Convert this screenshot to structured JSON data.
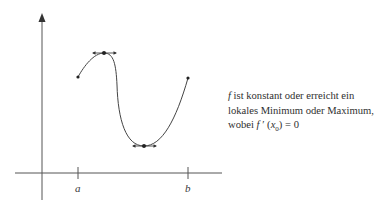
{
  "diagram": {
    "type": "function-graph",
    "axes": {
      "x_tick_labels": [
        "a",
        "b"
      ]
    },
    "curve": {
      "description": "Stetige Funktion f auf [a, b] mit einem lokalen Maximum und einem lokalen Minimum, jeweils mit waagerechter Tangente",
      "points": [
        {
          "name": "start",
          "label": "f(a)"
        },
        {
          "name": "local-maximum",
          "horizontal_tangent": true
        },
        {
          "name": "local-minimum",
          "horizontal_tangent": true
        },
        {
          "name": "end",
          "label": "f(b)"
        }
      ]
    },
    "colors": {
      "stroke": "#3a3a3a",
      "background": "#ffffff"
    }
  },
  "caption": {
    "f_symbol": "f",
    "line1_rest": " ist konstant oder erreicht ein",
    "line2": "lokales Minimum oder Maximum,",
    "line3_prefix": "wobei ",
    "line3_f": "f",
    "line3_prime": " ′ (",
    "line3_x": "x",
    "line3_sub": "0",
    "line3_suffix": ") = 0"
  }
}
